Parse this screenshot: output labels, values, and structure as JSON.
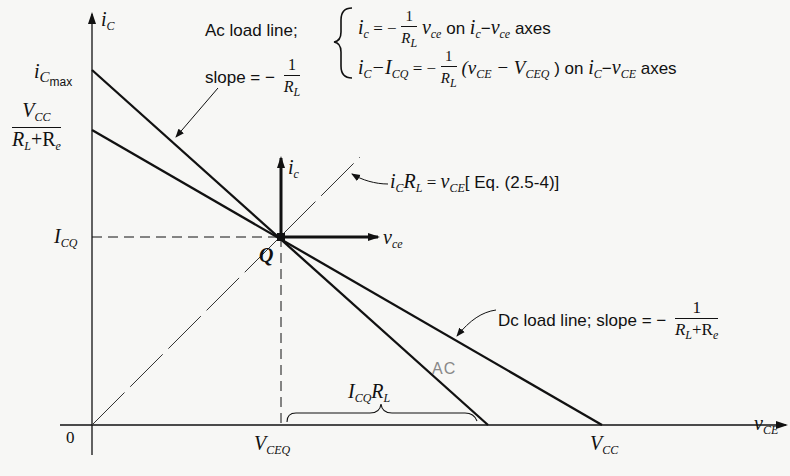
{
  "diagram": {
    "axes": {
      "y_label": "i",
      "y_label_sub": "C",
      "x_label": "v",
      "x_label_sub": "CE",
      "origin_label": "0"
    },
    "y_ticks": {
      "ic_max": {
        "main": "i",
        "sub": "C",
        "sub2": "max"
      },
      "vcc_over": {
        "num_main": "V",
        "num_sub": "CC",
        "den": "R",
        "den_sub1": "L",
        "den_plus": "+R",
        "den_sub2": "e"
      },
      "icq": {
        "main": "I",
        "sub": "CQ"
      }
    },
    "x_ticks": {
      "vceq": {
        "main": "V",
        "sub": "CEQ"
      },
      "vcc": {
        "main": "V",
        "sub": "CC"
      }
    },
    "q_point": {
      "label": "Q",
      "local_y": "i",
      "local_y_sub": "c",
      "local_x": "v",
      "local_x_sub": "ce"
    },
    "ac_annotation": {
      "line1": "Ac load line;",
      "line2": "slope = −",
      "frac_num": "1",
      "frac_den": "R",
      "frac_den_sub": "L",
      "eq1_lhs": "i",
      "eq1_lhs_sub": "c",
      "eq1_eq": " = −",
      "eq1_v": "v",
      "eq1_v_sub": "ce",
      "eq1_tail": " on ",
      "eq1_axes_a": "i",
      "eq1_axes_a_sub": "c",
      "eq1_axes_dash": "−",
      "eq1_axes_b": "v",
      "eq1_axes_b_sub": "ce",
      "eq1_end": " axes",
      "eq2_lhs": "i",
      "eq2_lhs_sub": "C",
      "eq2_minus": "−I",
      "eq2_minus_sub": "CQ",
      "eq2_eq": " = −",
      "eq2_paren_open": "(v",
      "eq2_paren_sub": "CE",
      "eq2_paren_mid": "− V",
      "eq2_paren_mid_sub": "CEQ",
      "eq2_paren_close": " )",
      "eq2_tail": " on ",
      "eq2_axes_a": "i",
      "eq2_axes_a_sub": "C",
      "eq2_axes_dash": "−",
      "eq2_axes_b": "v",
      "eq2_axes_b_sub": "CE",
      "eq2_end": " axes"
    },
    "ref_line_annotation": {
      "a": "i",
      "a_sub": "C",
      "b": "R",
      "b_sub": "L",
      "eq": " = ",
      "c": "v",
      "c_sub": "CE",
      "ref": "[ Eq. (2.5-4)]"
    },
    "dc_annotation": {
      "text": "Dc load line; slope = −",
      "frac_num": "1",
      "den_a": "R",
      "den_a_sub": "L",
      "den_plus": "+R",
      "den_b_sub": "e"
    },
    "brace_label": {
      "a": "I",
      "a_sub": "CQ",
      "b": "R",
      "b_sub": "L"
    },
    "handwritten_note": "AC"
  },
  "colors": {
    "ink": "#111111",
    "paper": "#f7f7f5",
    "pencil": "#888888"
  }
}
